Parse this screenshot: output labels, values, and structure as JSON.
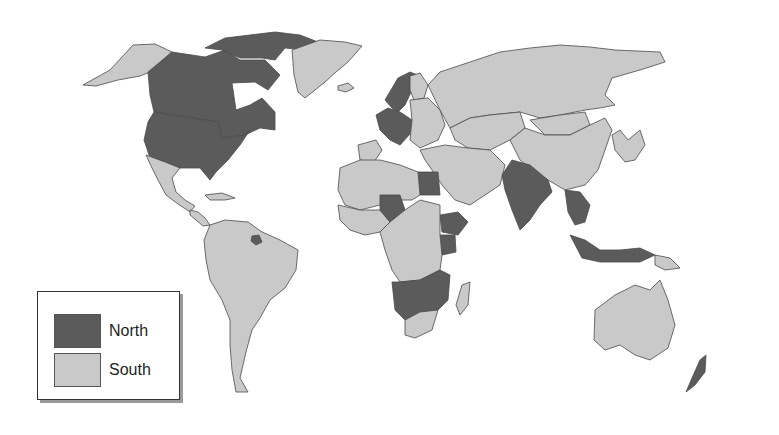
{
  "map": {
    "type": "choropleth",
    "title": "",
    "colors": {
      "North": "#5b5b5b",
      "South": "#c9c9c9",
      "border": "#4a4a4a",
      "background": "#ffffff"
    },
    "regions": [
      {
        "name": "Alaska (USA)",
        "category": "South"
      },
      {
        "name": "Canada",
        "category": "North"
      },
      {
        "name": "Canadian Arctic Islands",
        "category": "North"
      },
      {
        "name": "Greenland",
        "category": "South"
      },
      {
        "name": "Iceland",
        "category": "South"
      },
      {
        "name": "United States",
        "category": "North"
      },
      {
        "name": "Mexico",
        "category": "South"
      },
      {
        "name": "Central America",
        "category": "South"
      },
      {
        "name": "Caribbean",
        "category": "South"
      },
      {
        "name": "South America",
        "category": "South"
      },
      {
        "name": "Suriname",
        "category": "North"
      },
      {
        "name": "Scandinavia",
        "category": "North"
      },
      {
        "name": "Finland",
        "category": "South"
      },
      {
        "name": "Western Europe",
        "category": "North"
      },
      {
        "name": "Iberia",
        "category": "South"
      },
      {
        "name": "Eastern Europe",
        "category": "South"
      },
      {
        "name": "Russia",
        "category": "South"
      },
      {
        "name": "Central Asia",
        "category": "South"
      },
      {
        "name": "Mongolia",
        "category": "South"
      },
      {
        "name": "China",
        "category": "South"
      },
      {
        "name": "Korea & Japan",
        "category": "South"
      },
      {
        "name": "Middle East",
        "category": "South"
      },
      {
        "name": "Egypt",
        "category": "North"
      },
      {
        "name": "North Africa",
        "category": "South"
      },
      {
        "name": "West Africa",
        "category": "South"
      },
      {
        "name": "Niger",
        "category": "North"
      },
      {
        "name": "Ethiopia",
        "category": "North"
      },
      {
        "name": "Kenya",
        "category": "North"
      },
      {
        "name": "Central Africa",
        "category": "South"
      },
      {
        "name": "Southern Africa (Zambia–Mozambique–Botswana)",
        "category": "North"
      },
      {
        "name": "South Africa",
        "category": "South"
      },
      {
        "name": "Madagascar",
        "category": "South"
      },
      {
        "name": "India",
        "category": "North"
      },
      {
        "name": "Southeast Asia",
        "category": "North"
      },
      {
        "name": "Indonesia & Malaysia",
        "category": "North"
      },
      {
        "name": "Papua New Guinea",
        "category": "South"
      },
      {
        "name": "Australia",
        "category": "South"
      },
      {
        "name": "New Zealand",
        "category": "North"
      }
    ]
  },
  "legend": {
    "items": [
      {
        "label": "North",
        "category": "North"
      },
      {
        "label": "South",
        "category": "South"
      }
    ]
  }
}
